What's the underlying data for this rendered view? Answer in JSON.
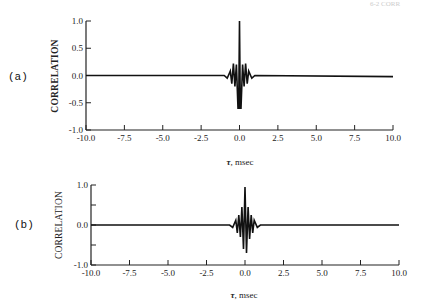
{
  "corner_text": "6-2 CORR",
  "chart_data": [
    {
      "type": "line",
      "panel_label": "(a)",
      "title": "",
      "xlabel": "τ, msec",
      "ylabel": "CORRELATION",
      "xlim": [
        -10.0,
        10.0
      ],
      "ylim": [
        -1.0,
        1.0
      ],
      "x_ticks": [
        "-10.0",
        "-7.5",
        "-5.0",
        "-2.5",
        "0.0",
        "2.5",
        "5.0",
        "7.5",
        "10.0"
      ],
      "y_ticks": [
        "1.0",
        "0.5",
        "0.0",
        "-0.5",
        "-1.0"
      ],
      "grid": false,
      "series": [
        {
          "name": "correlation",
          "x": [
            -10.0,
            -1.0,
            -0.8,
            -0.6,
            -0.5,
            -0.4,
            -0.3,
            -0.2,
            -0.1,
            -0.05,
            0.0,
            0.05,
            0.1,
            0.2,
            0.3,
            0.4,
            0.5,
            0.6,
            0.8,
            1.0,
            10.0
          ],
          "values": [
            0.0,
            0.0,
            -0.05,
            0.08,
            -0.15,
            0.22,
            -0.2,
            0.2,
            -0.6,
            -0.6,
            1.0,
            -0.6,
            -0.6,
            0.2,
            -0.2,
            0.22,
            -0.15,
            0.08,
            -0.05,
            0.0,
            -0.02
          ]
        }
      ]
    },
    {
      "type": "line",
      "panel_label": "(b)",
      "title": "",
      "xlabel": "τ, msec",
      "ylabel": "CORRELATION",
      "xlim": [
        -10.0,
        10.0
      ],
      "ylim": [
        -1.0,
        1.0
      ],
      "x_ticks": [
        "-10.0",
        "-7.5",
        "-5.0",
        "-2.5",
        "0.0",
        "2.5",
        "5.0",
        "7.5",
        "10.0"
      ],
      "y_ticks": [
        "1.0",
        "",
        "0.0",
        "",
        "-1.0"
      ],
      "grid": false,
      "series": [
        {
          "name": "correlation",
          "x": [
            -10.0,
            -1.0,
            -0.8,
            -0.6,
            -0.5,
            -0.4,
            -0.3,
            -0.2,
            -0.1,
            0.0,
            0.1,
            0.2,
            0.3,
            0.4,
            0.5,
            0.6,
            0.8,
            1.0,
            10.0
          ],
          "values": [
            0.0,
            0.0,
            -0.06,
            0.12,
            -0.2,
            0.25,
            -0.3,
            0.45,
            -0.6,
            0.95,
            -0.7,
            0.45,
            -0.35,
            0.25,
            -0.2,
            0.12,
            -0.06,
            0.0,
            0.0
          ]
        }
      ]
    }
  ]
}
